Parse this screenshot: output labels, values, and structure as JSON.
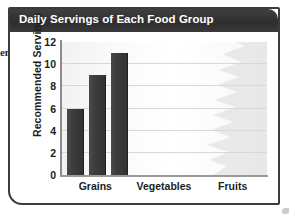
{
  "page": {
    "margin_fragment": "en",
    "speck_name": "scan-artifact-speck"
  },
  "figure": {
    "title": "Daily Servings of Each Food Group",
    "title_bar_color": "#333333",
    "title_text_color": "#ffffff",
    "frame_color": "#3b3b3b",
    "bar_color": "#3c3c3c",
    "gridline_color": "#d8d8d8",
    "axis_color": "#8d8d8d"
  },
  "chart_data": {
    "type": "bar",
    "title": "Daily Servings of Each Food Group",
    "xlabel": "",
    "ylabel": "Recommended Servings",
    "categories": [
      "Grains",
      "Vegetables",
      "Fruits"
    ],
    "series": [
      {
        "name": "Bar 1",
        "values": [
          6,
          null,
          null
        ]
      },
      {
        "name": "Bar 2",
        "values": [
          9,
          null,
          null
        ]
      },
      {
        "name": "Bar 3",
        "values": [
          11,
          null,
          null
        ]
      }
    ],
    "bars": [
      {
        "category": "Grains",
        "index": 0,
        "value": 6
      },
      {
        "category": "Grains",
        "index": 1,
        "value": 9
      },
      {
        "category": "Grains",
        "index": 2,
        "value": 11
      }
    ],
    "ylim": [
      0,
      12
    ],
    "yticks": [
      0,
      2,
      4,
      6,
      8,
      10,
      12
    ],
    "ytick_labels": [
      "0",
      "2",
      "4",
      "6",
      "8",
      "10",
      "12"
    ],
    "grid": true,
    "grid_axis": "y",
    "legend": false,
    "legend_position": "none"
  }
}
